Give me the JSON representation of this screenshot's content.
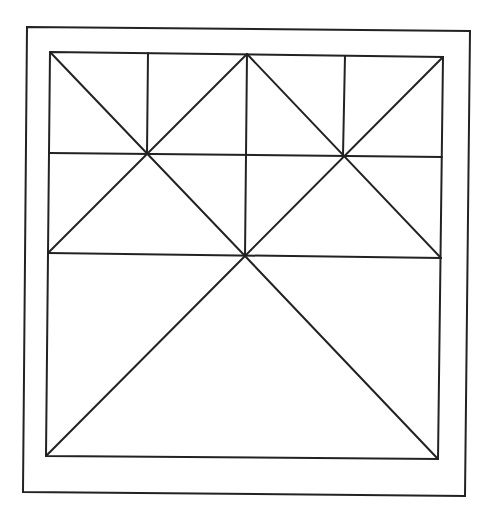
{
  "diagram": {
    "stroke_color": "#222222",
    "background_color": "#ffffff",
    "outer_frame": {
      "points": [
        [
          27,
          27
        ],
        [
          470,
          31
        ],
        [
          465,
          496
        ],
        [
          23,
          492
        ]
      ],
      "stroke_width": 2
    },
    "inner_square": {
      "points": [
        [
          50,
          52
        ],
        [
          443,
          57
        ],
        [
          438,
          459
        ],
        [
          46,
          456
        ]
      ],
      "stroke_width": 2
    },
    "lines": [
      {
        "id": "h-line-upper",
        "x1": 49,
        "y1": 153,
        "x2": 442,
        "y2": 157
      },
      {
        "id": "h-line-lower",
        "x1": 48,
        "y1": 253,
        "x2": 441,
        "y2": 258
      },
      {
        "id": "v-line-left",
        "x1": 148,
        "y1": 53,
        "x2": 147,
        "y2": 153
      },
      {
        "id": "v-line-center",
        "x1": 247,
        "y1": 54,
        "x2": 245,
        "y2": 256
      },
      {
        "id": "v-line-right",
        "x1": 345,
        "y1": 56,
        "x2": 343,
        "y2": 155
      },
      {
        "id": "diag-tl-to-center",
        "x1": 50,
        "y1": 52,
        "x2": 245,
        "y2": 256
      },
      {
        "id": "diag-top-mid-to-left-mid",
        "x1": 247,
        "y1": 54,
        "x2": 48,
        "y2": 253
      },
      {
        "id": "diag-top-mid-to-right-mid",
        "x1": 247,
        "y1": 54,
        "x2": 441,
        "y2": 258
      },
      {
        "id": "diag-tr-to-center",
        "x1": 443,
        "y1": 57,
        "x2": 245,
        "y2": 256
      },
      {
        "id": "diag-center-to-bl",
        "x1": 245,
        "y1": 256,
        "x2": 46,
        "y2": 456
      },
      {
        "id": "diag-center-to-br",
        "x1": 245,
        "y1": 256,
        "x2": 438,
        "y2": 459
      }
    ],
    "line_stroke_width": 2
  }
}
